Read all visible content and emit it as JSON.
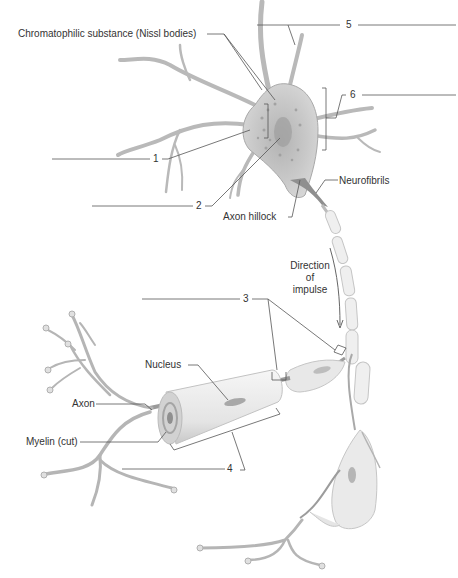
{
  "diagram": {
    "labels": {
      "nissl": "Chromatophilic substance (Nissl bodies)",
      "neurofibrils": "Neurofibrils",
      "axon_hillock": "Axon hillock",
      "direction": [
        "Direction",
        "of",
        "impulse"
      ],
      "nucleus": "Nucleus",
      "axon": "Axon",
      "myelin": "Myelin (cut)"
    },
    "blanks": [
      {
        "number": "1"
      },
      {
        "number": "2"
      },
      {
        "number": "3"
      },
      {
        "number": "4"
      },
      {
        "number": "5"
      },
      {
        "number": "6"
      }
    ],
    "colors": {
      "line": "#555555",
      "cell_fill": "#c8c8c8",
      "cell_dark": "#9a9a9a",
      "sheath_fill": "#ececec",
      "text": "#333333"
    }
  }
}
